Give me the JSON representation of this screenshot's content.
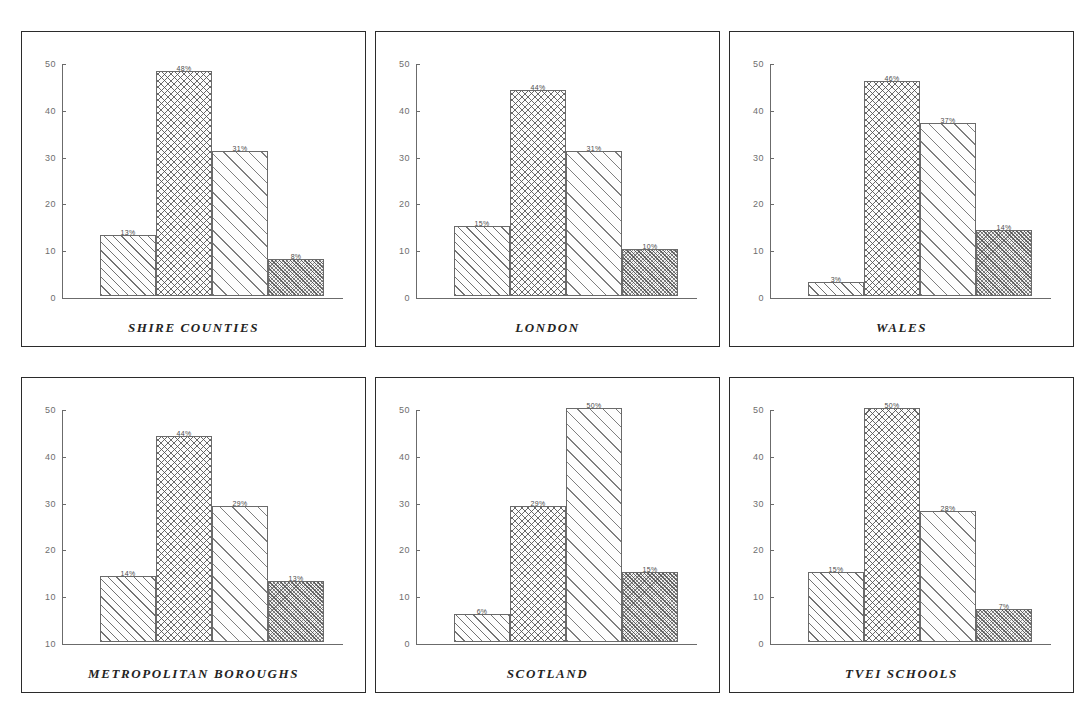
{
  "figure": {
    "background": "#ffffff",
    "panel_border_color": "#2b2b2b",
    "axis_color": "#6b6b6b",
    "label_color": "#4a4a4a",
    "title_color": "#232323"
  },
  "chart_data": [
    {
      "type": "bar",
      "title": "SHIRE COUNTIES",
      "categories": [
        "1",
        "2",
        "3",
        "4"
      ],
      "values": [
        13,
        48,
        31,
        8
      ],
      "data_labels": [
        "13%",
        "48%",
        "31%",
        "8%"
      ],
      "yticks": [
        0,
        10,
        20,
        30,
        40,
        50
      ],
      "ytick_labels": [
        "0",
        "10",
        "20",
        "30",
        "40",
        "50"
      ],
      "ylim": [
        0,
        50
      ],
      "xlabel": "",
      "ylabel": "",
      "grid": false,
      "legend": "none",
      "patterns": [
        "pat-1",
        "pat-2",
        "pat-3",
        "pat-4"
      ]
    },
    {
      "type": "bar",
      "title": "LONDON",
      "categories": [
        "1",
        "2",
        "3",
        "4"
      ],
      "values": [
        15,
        44,
        31,
        10
      ],
      "data_labels": [
        "15%",
        "44%",
        "31%",
        "10%"
      ],
      "yticks": [
        0,
        10,
        20,
        30,
        40,
        50
      ],
      "ytick_labels": [
        "0",
        "10",
        "20",
        "30",
        "40",
        "50"
      ],
      "ylim": [
        0,
        50
      ],
      "xlabel": "",
      "ylabel": "",
      "grid": false,
      "legend": "none",
      "patterns": [
        "pat-1",
        "pat-2",
        "pat-3",
        "pat-4"
      ]
    },
    {
      "type": "bar",
      "title": "WALES",
      "categories": [
        "1",
        "2",
        "3",
        "4"
      ],
      "values": [
        3,
        46,
        37,
        14
      ],
      "data_labels": [
        "3%",
        "46%",
        "37%",
        "14%"
      ],
      "yticks": [
        0,
        10,
        20,
        30,
        40,
        50
      ],
      "ytick_labels": [
        "0",
        "10",
        "20",
        "30",
        "40",
        "50"
      ],
      "ylim": [
        0,
        50
      ],
      "xlabel": "",
      "ylabel": "",
      "grid": false,
      "legend": "none",
      "patterns": [
        "pat-1",
        "pat-2",
        "pat-3",
        "pat-4"
      ]
    },
    {
      "type": "bar",
      "title": "METROPOLITAN BOROUGHS",
      "categories": [
        "1",
        "2",
        "3",
        "4"
      ],
      "values": [
        14,
        44,
        29,
        13
      ],
      "data_labels": [
        "14%",
        "44%",
        "29%",
        "13%"
      ],
      "yticks": [
        0,
        10,
        20,
        30,
        40,
        50
      ],
      "ytick_labels": [
        "10",
        "10",
        "20",
        "30",
        "40",
        "50"
      ],
      "ylim": [
        0,
        50
      ],
      "xlabel": "",
      "ylabel": "",
      "grid": false,
      "legend": "none",
      "patterns": [
        "pat-1",
        "pat-2",
        "pat-3",
        "pat-4"
      ]
    },
    {
      "type": "bar",
      "title": "SCOTLAND",
      "categories": [
        "1",
        "2",
        "3",
        "4"
      ],
      "values": [
        6,
        29,
        50,
        15
      ],
      "data_labels": [
        "6%",
        "29%",
        "50%",
        "15%"
      ],
      "yticks": [
        0,
        10,
        20,
        30,
        40,
        50
      ],
      "ytick_labels": [
        "0",
        "10",
        "20",
        "30",
        "40",
        "50"
      ],
      "ylim": [
        0,
        50
      ],
      "xlabel": "",
      "ylabel": "",
      "grid": false,
      "legend": "none",
      "patterns": [
        "pat-1",
        "pat-2",
        "pat-3",
        "pat-4"
      ]
    },
    {
      "type": "bar",
      "title": "TVEI SCHOOLS",
      "categories": [
        "1",
        "2",
        "3",
        "4"
      ],
      "values": [
        15,
        50,
        28,
        7
      ],
      "data_labels": [
        "15%",
        "50%",
        "28%",
        "7%"
      ],
      "yticks": [
        0,
        10,
        20,
        30,
        40,
        50
      ],
      "ytick_labels": [
        "0",
        "10",
        "20",
        "30",
        "40",
        "50"
      ],
      "ylim": [
        0,
        50
      ],
      "xlabel": "",
      "ylabel": "",
      "grid": false,
      "legend": "none",
      "patterns": [
        "pat-1",
        "pat-2",
        "pat-3",
        "pat-4"
      ]
    }
  ]
}
